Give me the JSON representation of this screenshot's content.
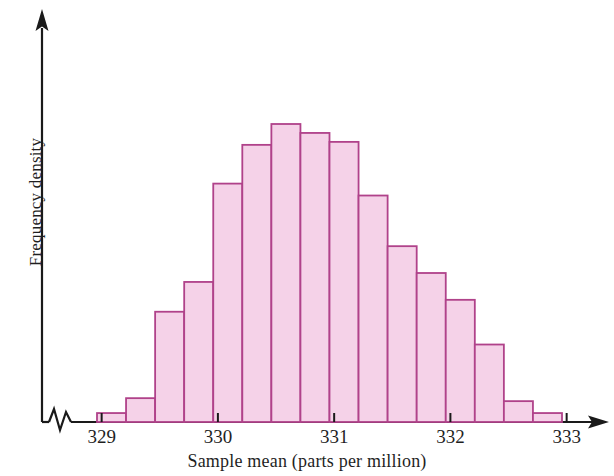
{
  "chart_data": {
    "type": "bar",
    "title": "",
    "subtitle": "",
    "xlabel": "Sample mean (parts per million)",
    "ylabel": "Frequency density",
    "grid": false,
    "legend": null,
    "axis_style": "arrow-headed axes with zigzag break on x-axis",
    "xlim": [
      328.72,
      333.34
    ],
    "ylim": [
      0,
      1.0
    ],
    "xticks": [
      329,
      330,
      331,
      332,
      333
    ],
    "xtick_labels": [
      "329",
      "330",
      "331",
      "332",
      "333"
    ],
    "yticks": [],
    "ytick_labels": [],
    "bin_width": 0.25,
    "bin_edges": [
      328.96,
      329.21,
      329.46,
      329.71,
      329.96,
      330.21,
      330.46,
      330.71,
      330.96,
      331.21,
      331.46,
      331.71,
      331.96,
      332.21,
      332.46,
      332.71,
      332.96
    ],
    "categories": [
      "328.96-329.21",
      "329.21-329.46",
      "329.46-329.71",
      "329.71-329.96",
      "329.96-330.21",
      "330.21-330.46",
      "330.46-330.71",
      "330.71-330.96",
      "330.96-331.21",
      "331.21-331.46",
      "331.46-331.71",
      "331.71-331.96",
      "331.96-332.21",
      "332.21-332.46",
      "332.46-332.71",
      "332.71-332.96"
    ],
    "values": [
      0.03,
      0.08,
      0.37,
      0.47,
      0.8,
      0.93,
      1.0,
      0.97,
      0.94,
      0.76,
      0.59,
      0.5,
      0.41,
      0.26,
      0.07,
      0.03
    ],
    "bar_fill_color": "#f5d2e8",
    "bar_border_color": "#b0428a",
    "axis_color": "#1a1a1a"
  },
  "axes": {
    "x_axis_label": "Sample mean (parts per million)",
    "y_axis_label": "Frequency density"
  }
}
